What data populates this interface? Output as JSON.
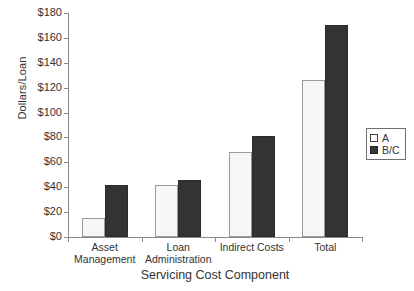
{
  "chart_data": {
    "type": "bar",
    "title": "",
    "xlabel": "Servicing Cost Component",
    "ylabel": "Dollars/Loan",
    "categories": [
      "Asset\nManagement",
      "Loan\nAdministration",
      "Indirect Costs",
      "Total"
    ],
    "series": [
      {
        "name": "A",
        "values": [
          15,
          42,
          68,
          126
        ]
      },
      {
        "name": "B/C",
        "values": [
          42,
          46,
          81,
          170
        ]
      }
    ],
    "ylim": [
      0,
      180
    ],
    "ytick_values": [
      0,
      20,
      40,
      60,
      80,
      100,
      120,
      140,
      160,
      180
    ],
    "ytick_labels": [
      "$0",
      "$20",
      "$40",
      "$60",
      "$80",
      "$100",
      "$120",
      "$140",
      "$160",
      "$180"
    ],
    "grid": false,
    "legend_position": "right",
    "legend_entries": [
      "A",
      "B/C"
    ],
    "colors": {
      "series_a": "#f7f7f7",
      "series_bc": "#333333",
      "axis": "#8b8b8b",
      "text": "#333333"
    }
  }
}
